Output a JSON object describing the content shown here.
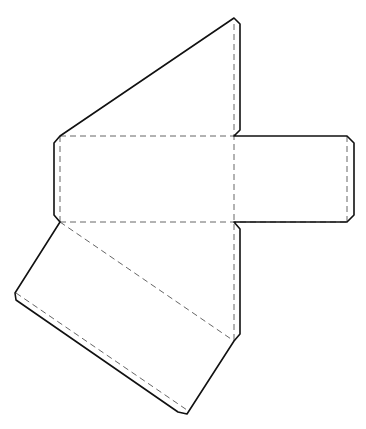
{
  "diagram": {
    "title": "Folding net",
    "type": "net-template",
    "colors": {
      "background": "#ffffff",
      "cut_line": "#111111",
      "fold_line": "#555555"
    },
    "cut_outline_points": "234,18 240,24 240,130 234,136 347,136 354,143 354,215 347,222 234,222 240,229 240,334 234,341 187,414 178,412 16,300 15,293 60,222 54,215 54,143 60,136",
    "fold_lines": [
      {
        "id": "fold-vertical-center",
        "x1": 234,
        "y1": 24,
        "x2": 234,
        "y2": 341
      },
      {
        "id": "fold-top-horizontal",
        "x1": 60,
        "y1": 136,
        "x2": 234,
        "y2": 136
      },
      {
        "id": "fold-middle-horizontal",
        "x1": 60,
        "y1": 222,
        "x2": 347,
        "y2": 222
      },
      {
        "id": "fold-left-flap",
        "x1": 60,
        "y1": 136,
        "x2": 60,
        "y2": 222
      },
      {
        "id": "fold-right-flap",
        "x1": 347,
        "y1": 136,
        "x2": 347,
        "y2": 222
      },
      {
        "id": "fold-diagonal-upper",
        "x1": 60,
        "y1": 222,
        "x2": 234,
        "y2": 341
      },
      {
        "id": "fold-diagonal-lower",
        "x1": 16,
        "y1": 293,
        "x2": 187,
        "y2": 410
      }
    ]
  }
}
